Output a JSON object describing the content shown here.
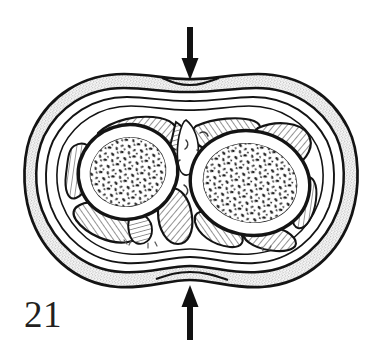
{
  "figure": {
    "number_label": "21",
    "caption_text": "",
    "background_color": "#ffffff",
    "ink_color": "#1a1a1a",
    "stipple_fill_color": "#d9d9d9",
    "hatch_fill_color": "#b3b3b3",
    "marrow_fill_color": "#2b2b2b",
    "view": "transverse-section"
  },
  "annotations": {
    "arrows": [
      {
        "name": "top-compression-arrow",
        "direction": "down",
        "x": 190,
        "y_start": 27,
        "y_end": 80,
        "color": "#111111",
        "shaft_width": 6,
        "head_width": 17,
        "head_length": 22
      },
      {
        "name": "bottom-compression-arrow",
        "direction": "up",
        "x": 190,
        "y_start": 338,
        "y_end": 285,
        "color": "#111111",
        "shaft_width": 6,
        "head_width": 17,
        "head_length": 22
      }
    ]
  },
  "structures": {
    "skin_outline": {
      "label": "skin-and-subcutaneous-layer",
      "fill": "#d9d9d9",
      "stroke": "#141414",
      "stroke_width": 2.6
    },
    "deep_fascia_rings": [
      {
        "label": "outer-deep-fascia",
        "stroke_width": 2.4
      },
      {
        "label": "middle-fascia",
        "stroke_width": 2.0
      },
      {
        "label": "inner-fascia",
        "stroke_width": 1.8
      }
    ],
    "bones": [
      {
        "label": "radius",
        "side": "left",
        "cx": 128,
        "cy": 172,
        "rx": 50,
        "ry": 47,
        "rotation": -18,
        "cortex_stroke_width": 3.4,
        "marrow_label": "cancellous-trabecular-marrow"
      },
      {
        "label": "ulna",
        "side": "right",
        "cx": 248,
        "cy": 182,
        "rx": 60,
        "ry": 52,
        "rotation": 12,
        "cortex_stroke_width": 3.4,
        "marrow_label": "cancellous-trabecular-marrow"
      }
    ],
    "interosseous_region": {
      "label": "interosseous-membrane-and-vessels",
      "cx": 190,
      "cy": 165
    },
    "muscle_compartments": [
      {
        "label": "anterior-superficial-muscle-left"
      },
      {
        "label": "anterior-superficial-muscle-center"
      },
      {
        "label": "anterior-superficial-muscle-right"
      },
      {
        "label": "lateral-muscle-left"
      },
      {
        "label": "lateral-muscle-right"
      },
      {
        "label": "posterior-muscle-left"
      },
      {
        "label": "posterior-muscle-center"
      },
      {
        "label": "posterior-muscle-right"
      },
      {
        "label": "deep-muscle-interosseous"
      }
    ]
  }
}
